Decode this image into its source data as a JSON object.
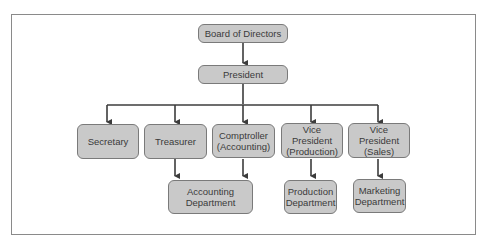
{
  "chart_title": "",
  "colors": {
    "node_fill": "#c9c9c9",
    "node_border": "#7a7a7a",
    "line": "#3c3c3c",
    "frame": "#8a8a8a",
    "text": "#3a3a3a"
  },
  "nodes": {
    "board": "Board of Directors",
    "president": "President",
    "secretary": "Secretary",
    "treasurer": "Treasurer",
    "comptroller": "Comptroller\n(Accounting)",
    "vp_production": "Vice President\n(Production)",
    "vp_sales": "Vice President\n(Sales)",
    "accounting_dept": "Accounting\nDepartment",
    "production_dept": "Production\nDepartment",
    "marketing_dept": "Marketing\nDepartment"
  },
  "edges": [
    [
      "Board of Directors",
      "President"
    ],
    [
      "President",
      "Secretary"
    ],
    [
      "President",
      "Treasurer"
    ],
    [
      "President",
      "Comptroller (Accounting)"
    ],
    [
      "President",
      "Vice President (Production)"
    ],
    [
      "President",
      "Vice President (Sales)"
    ],
    [
      "Treasurer",
      "Accounting Department"
    ],
    [
      "Comptroller (Accounting)",
      "Accounting Department"
    ],
    [
      "Vice President (Production)",
      "Production Department"
    ],
    [
      "Vice President (Sales)",
      "Marketing Department"
    ]
  ]
}
